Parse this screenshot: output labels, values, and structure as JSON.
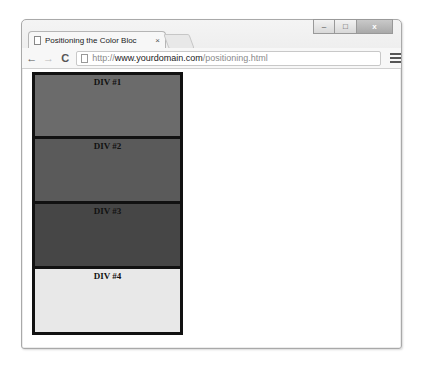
{
  "window": {
    "controls": {
      "minimize": "–",
      "maximize": "□",
      "close": "x"
    }
  },
  "tab": {
    "title": "Positioning the Color Blo​c",
    "close": "×"
  },
  "toolbar": {
    "back": "←",
    "forward": "→",
    "reload": "C",
    "url_scheme": "http://",
    "url_domain": "www.yourdomain.com",
    "url_path": "/positioning.html"
  },
  "page": {
    "blocks": [
      {
        "label": "DIV #1",
        "color": "#6b6b6b"
      },
      {
        "label": "DIV #2",
        "color": "#5a5a5a"
      },
      {
        "label": "DIV #3",
        "color": "#464646"
      },
      {
        "label": "DIV #4",
        "color": "#e8e8e8"
      }
    ]
  }
}
